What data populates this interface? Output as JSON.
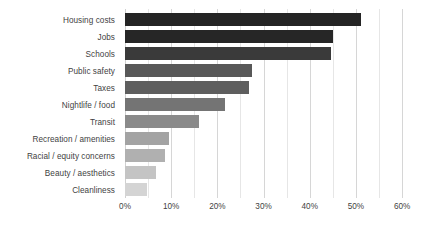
{
  "chart_data": {
    "type": "bar",
    "orientation": "horizontal",
    "title": "",
    "subtitle": "",
    "xlabel": "",
    "ylabel": "",
    "xlim": [
      0,
      63
    ],
    "grid": true,
    "grid_axis": "x",
    "legend": false,
    "legend_position": "none",
    "value_format": "percent",
    "categories": [
      "Housing costs",
      "Jobs",
      "Schools",
      "Public safety",
      "Taxes",
      "Nightlife / food",
      "Transit",
      "Recreation / amenities",
      "Racial / equity concerns",
      "Beauty / aesthetics",
      "Cleanliness"
    ],
    "values": [
      51,
      45,
      44.5,
      27.5,
      26.8,
      21.7,
      16.1,
      9.5,
      8.7,
      6.8,
      4.8
    ],
    "bar_colors": [
      "#242424",
      "#262626",
      "#3a3a3a",
      "#585858",
      "#5e5e5e",
      "#747474",
      "#8a8a8a",
      "#a3a3a3",
      "#b0b0b0",
      "#c4c4c4",
      "#d4d4d4"
    ],
    "tick_values": [
      0,
      10,
      20,
      30,
      40,
      50,
      60
    ],
    "tick_labels": [
      "0%",
      "10%",
      "20%",
      "30%",
      "40%",
      "50%",
      "60%"
    ],
    "minor_tick_values": [
      5,
      15,
      25,
      35,
      45,
      55
    ],
    "gridline_color": "#d9d9d9",
    "label_color": "#3f3f3f",
    "background_color": "#ffffff"
  }
}
